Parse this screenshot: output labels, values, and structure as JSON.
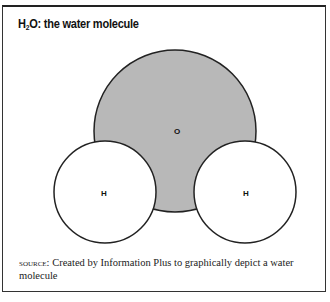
{
  "figure": {
    "title_prefix": "H",
    "title_subscript": "2",
    "title_suffix": "O: the water molecule",
    "atoms": [
      {
        "id": "oxygen",
        "label": "O",
        "cx": 175,
        "cy": 131,
        "r": 81,
        "fill": "#b8b8b8"
      },
      {
        "id": "hydrogen-left",
        "label": "H",
        "cx": 105,
        "cy": 192,
        "r": 51,
        "fill": "#ffffff"
      },
      {
        "id": "hydrogen-right",
        "label": "H",
        "cx": 245,
        "cy": 192,
        "r": 51,
        "fill": "#ffffff"
      }
    ],
    "stroke_color": "#222222"
  },
  "source": {
    "label": "SOURCE:",
    "text": " Created by Information Plus to graphically depict a water molecule"
  }
}
